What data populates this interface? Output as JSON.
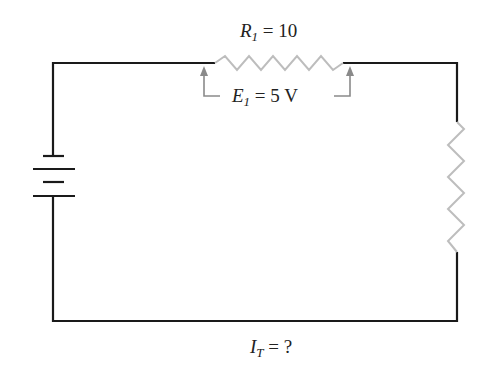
{
  "diagram": {
    "type": "series-circuit",
    "components": {
      "battery": {
        "label": "",
        "position": "left"
      },
      "r1": {
        "symbol": "R",
        "subscript": "1",
        "value": "10",
        "position": "top"
      },
      "r2": {
        "label": "",
        "position": "right"
      }
    },
    "labels": {
      "r1": {
        "symbol": "R",
        "subscript": "1",
        "eq": "=",
        "value": "10"
      },
      "e1": {
        "symbol": "E",
        "subscript": "1",
        "eq": "=",
        "value": "5 V"
      },
      "it": {
        "symbol": "I",
        "subscript": "T",
        "eq": "=",
        "value": "?"
      }
    },
    "colors": {
      "wire": "#1a1a1a",
      "resistor": "#bdbdbd",
      "arrow": "#8a8a8a"
    }
  }
}
